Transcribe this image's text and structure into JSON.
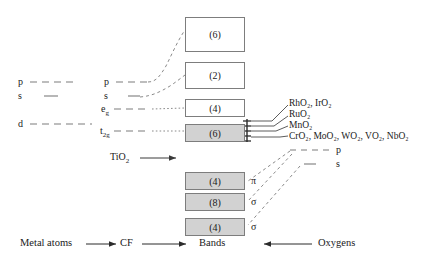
{
  "diagram": {
    "colors": {
      "line": "#7d7d7d",
      "shaded_fill": "#d2d2d2",
      "box_border": "#7d7d7d",
      "text": "#1a1a1a"
    },
    "metal_atom_levels": [
      {
        "label": "p",
        "name": "metal-level-p"
      },
      {
        "label": "s",
        "name": "metal-level-s"
      },
      {
        "label": "d",
        "name": "metal-level-d"
      }
    ],
    "crystal_field_levels": [
      {
        "label": "p",
        "sub": "",
        "name": "cf-level-p"
      },
      {
        "label": "s",
        "sub": "",
        "name": "cf-level-s"
      },
      {
        "label": "e",
        "sub": "g",
        "name": "cf-level-eg"
      },
      {
        "label": "t",
        "sub": "2g",
        "name": "cf-level-t2g"
      }
    ],
    "bands": [
      {
        "degeneracy": "(6)",
        "shaded": false,
        "name": "band-box-6-upper"
      },
      {
        "degeneracy": "(2)",
        "shaded": false,
        "name": "band-box-2"
      },
      {
        "degeneracy": "(4)",
        "shaded": false,
        "name": "band-box-4-eg"
      },
      {
        "degeneracy": "(6)",
        "shaded": true,
        "name": "band-box-6-t2g"
      },
      {
        "degeneracy": "(4)",
        "shaded": true,
        "name": "band-box-4-pi"
      },
      {
        "degeneracy": "(8)",
        "shaded": true,
        "name": "band-box-8-sigma"
      },
      {
        "degeneracy": "(4)",
        "shaded": true,
        "name": "band-box-4-sigma"
      }
    ],
    "band_symmetry_labels": [
      {
        "label": "π",
        "name": "symmetry-label-pi"
      },
      {
        "label": "σ",
        "name": "symmetry-label-sigma-8"
      },
      {
        "label": "σ",
        "name": "symmetry-label-sigma-4"
      }
    ],
    "compound_rows": [
      {
        "text": "RhO₂, IrO₂",
        "name": "compound-row-rho2-iro2"
      },
      {
        "text": "RuO₂",
        "name": "compound-row-ruo2"
      },
      {
        "text": "MnO₂",
        "name": "compound-row-mno2"
      },
      {
        "text": "CrO₂, MoO₂, WO₂, VO₂, NbO₂",
        "name": "compound-row-cro2-moo2-wo2-vo2-nbo2"
      }
    ],
    "oxygen_levels": [
      {
        "label": "p",
        "name": "oxygen-level-p"
      },
      {
        "label": "s",
        "name": "oxygen-level-s"
      }
    ],
    "annotation": {
      "text": "TiO₂",
      "name": "tio2-annotation"
    },
    "bottom_axis": [
      {
        "text": "Metal atoms",
        "name": "axis-metal-atoms"
      },
      {
        "text": "CF",
        "name": "axis-cf"
      },
      {
        "text": "Bands",
        "name": "axis-bands"
      },
      {
        "text": "Oxygens",
        "name": "axis-oxygens"
      }
    ]
  }
}
